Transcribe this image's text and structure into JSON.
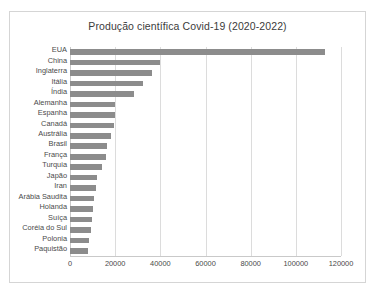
{
  "chart_data": {
    "type": "bar",
    "orientation": "horizontal",
    "title": "Produção científica Covid-19 (2020-2022)",
    "xlabel": "",
    "ylabel": "",
    "xlim": [
      0,
      120000
    ],
    "xticks": [
      0,
      20000,
      40000,
      60000,
      80000,
      100000,
      120000
    ],
    "xtick_labels": [
      "0",
      "20000",
      "40000",
      "60000",
      "80000",
      "100000",
      "120000"
    ],
    "grid": "vertical",
    "legend": "none",
    "bar_color": "#8c8c8c",
    "categories": [
      "EUA",
      "China",
      "Inglaterra",
      "Itália",
      "Índia",
      "Alemanha",
      "Espanha",
      "Canadá",
      "Austrália",
      "Brasil",
      "França",
      "Turquia",
      "Japão",
      "Iran",
      "Arábia Saudita",
      "Holanda",
      "Suíça",
      "Coréia do Sul",
      "Polonia",
      "Paquistão"
    ],
    "values": [
      113000,
      40000,
      36500,
      32500,
      28500,
      20000,
      20000,
      19700,
      18200,
      16200,
      16000,
      14000,
      12000,
      11700,
      10800,
      10000,
      9600,
      9200,
      8200,
      7800
    ]
  }
}
